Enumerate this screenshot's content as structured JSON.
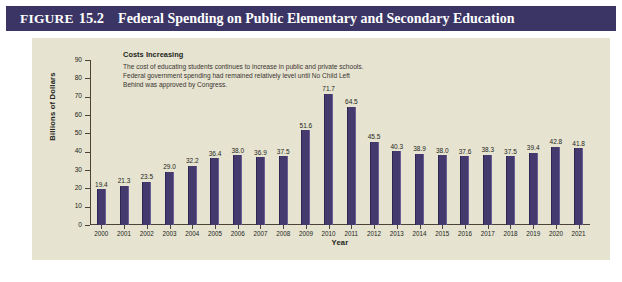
{
  "figure": {
    "label": "Figure",
    "number": "15.2",
    "title": "Federal Spending on Public Elementary and Secondary Education"
  },
  "annotation": {
    "heading": "Costs Increasing",
    "lines": [
      "The cost of educating students continues to increase in public and private schools.",
      "Federal government spending had remained relatively level until No Child Left",
      "Behind was approved by Congress."
    ]
  },
  "colors": {
    "header_background": "#3b3565",
    "header_text": "#ffffff",
    "panel_background": "#e6e3d0",
    "bar": "#453a6e",
    "axis": "#4b4436",
    "text": "#231f20"
  },
  "chart_data": {
    "type": "bar",
    "title": "Federal Spending on Public Elementary and Secondary Education",
    "xlabel": "Year",
    "ylabel": "Billions of Dollars",
    "ylim": [
      0,
      90
    ],
    "yticks": [
      0,
      10,
      20,
      30,
      40,
      50,
      60,
      70,
      80,
      90
    ],
    "ytick_labels": [
      "0",
      "10",
      "20",
      "30",
      "40",
      "50",
      "60",
      "70",
      "80",
      "90"
    ],
    "grid": false,
    "legend": null,
    "categories": [
      "2000",
      "2001",
      "2002",
      "2003",
      "2004",
      "2005",
      "2006",
      "2007",
      "2008",
      "2009",
      "2010",
      "2011",
      "2012",
      "2013",
      "2014",
      "2015",
      "2016",
      "2017",
      "2018",
      "2019",
      "2020",
      "2021"
    ],
    "values": [
      19.4,
      21.3,
      23.5,
      29.0,
      32.2,
      36.4,
      38.0,
      36.9,
      37.5,
      51.6,
      71.7,
      64.5,
      45.5,
      40.3,
      38.9,
      38.0,
      37.6,
      38.3,
      37.5,
      39.4,
      42.8,
      41.8
    ],
    "value_labels": [
      "19.4",
      "21.3",
      "23.5",
      "29.0",
      "32.2",
      "36.4",
      "38.0",
      "36.9",
      "37.5",
      "51.6",
      "71.7",
      "64.5",
      "45.5",
      "40.3",
      "38.9",
      "38.0",
      "37.6",
      "38.3",
      "37.5",
      "39.4",
      "42.8",
      "41.8"
    ],
    "annotations": [
      "Costs Increasing",
      "The cost of educating students continues to increase in public and private schools.",
      "Federal government spending had remained relatively level until No Child Left",
      "Behind was approved by Congress."
    ]
  }
}
